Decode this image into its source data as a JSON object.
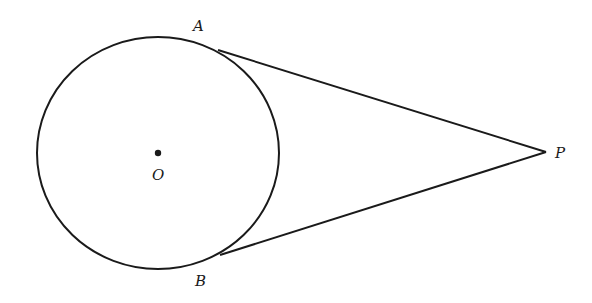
{
  "diagram": {
    "title": "",
    "stroke_color": "#1a1a1a",
    "circle": {
      "cx": 158,
      "cy": 153,
      "rx": 121,
      "ry": 116,
      "center_label": "O"
    },
    "points": {
      "A": {
        "label": "A",
        "x": 218,
        "y": 50,
        "label_x": 193,
        "label_y": 31
      },
      "B": {
        "label": "B",
        "x": 220,
        "y": 255,
        "label_x": 195,
        "label_y": 286
      },
      "P": {
        "label": "P",
        "x": 546,
        "y": 152,
        "label_x": 555,
        "label_y": 158
      },
      "O": {
        "label": "O",
        "x": 158,
        "y": 153,
        "label_x": 152,
        "label_y": 180
      }
    },
    "segments": [
      {
        "from": "A",
        "to": "P",
        "kind": "tangent"
      },
      {
        "from": "B",
        "to": "P",
        "kind": "tangent"
      }
    ]
  }
}
